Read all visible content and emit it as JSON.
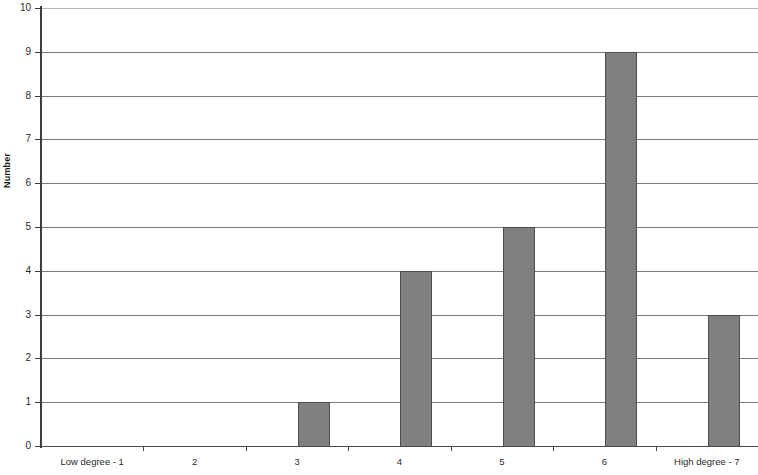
{
  "chart_data": {
    "type": "bar",
    "title": "",
    "xlabel": "",
    "ylabel": "Number",
    "categories": [
      "Low degree - 1",
      "2",
      "3",
      "4",
      "5",
      "6",
      "High degree - 7"
    ],
    "values": [
      0,
      0,
      1,
      4,
      5,
      9,
      3
    ],
    "ylim": [
      0,
      10
    ],
    "y_ticks": [
      "0",
      "1",
      "2",
      "3",
      "4",
      "5",
      "6",
      "7",
      "8",
      "9",
      "10"
    ],
    "y_tick_values": [
      0,
      1,
      2,
      3,
      4,
      5,
      6,
      7,
      8,
      9,
      10
    ],
    "grid": "horizontal",
    "legend": "none",
    "bar_color": "#808080",
    "bar_border_color": "#4d4d4d",
    "gridline_color": "#7a7a7a",
    "axis_color": "#3d3d3d",
    "background": "#ffffff"
  }
}
